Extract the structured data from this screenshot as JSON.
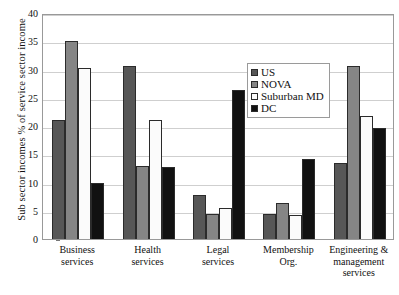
{
  "chart_data": {
    "type": "bar",
    "title": "",
    "xlabel": "",
    "ylabel": "Sub sector incomes % of service sector income",
    "ylim": [
      0,
      40
    ],
    "yticks": [
      0,
      5,
      10,
      15,
      20,
      25,
      30,
      35,
      40
    ],
    "grid": true,
    "legend_position": "inside-upper-right",
    "categories": [
      "Business services",
      "Health services",
      "Legal services",
      "Membership Org.",
      "Engineering & management services"
    ],
    "series": [
      {
        "name": "US",
        "color": "#575757",
        "values": [
          21.0,
          30.7,
          7.8,
          4.5,
          13.5
        ]
      },
      {
        "name": "NOVA",
        "color": "#858585",
        "values": [
          35.0,
          13.0,
          4.5,
          6.3,
          30.7
        ]
      },
      {
        "name": "Suburban MD",
        "color": "#fbfbfb",
        "values": [
          30.3,
          21.0,
          5.5,
          4.2,
          21.7
        ]
      },
      {
        "name": "DC",
        "color": "#111111",
        "values": [
          10.0,
          12.7,
          26.3,
          14.2,
          19.7
        ]
      }
    ]
  },
  "axis": {
    "y_title": "Sub sector incomes % of service sector income",
    "y_tick_labels": [
      "0",
      "5",
      "10",
      "15",
      "20",
      "25",
      "30",
      "35",
      "40"
    ]
  },
  "legend": {
    "items": [
      {
        "label": "US"
      },
      {
        "label": "NOVA"
      },
      {
        "label": "Suburban MD"
      },
      {
        "label": "DC"
      }
    ]
  },
  "x_labels": [
    "Business\nservices",
    "Health\nservices",
    "Legal\nservices",
    "Membership\nOrg.",
    "Engineering &\nmanagement\nservices"
  ]
}
